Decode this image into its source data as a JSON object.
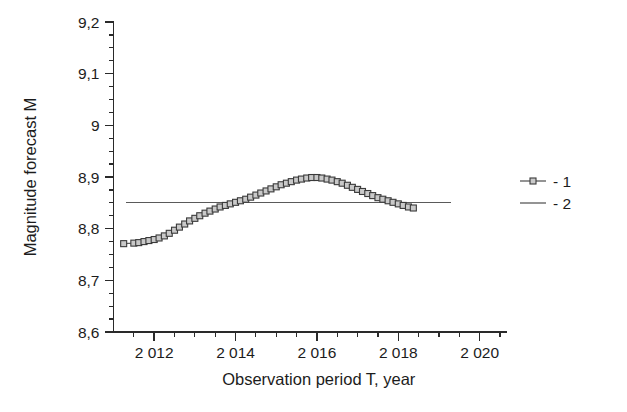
{
  "chart_data": {
    "type": "line",
    "title": "",
    "xlabel": "Observation period T, year",
    "ylabel": "Magnitude forecast  M",
    "xlim": [
      2011.0,
      2020.5
    ],
    "ylim": [
      8.6,
      9.2
    ],
    "grid": false,
    "legend_position": "right",
    "x_tick_labels": [
      "2 012",
      "2 014",
      "2 016",
      "2 018",
      "2 020"
    ],
    "x_tick_values": [
      2012,
      2014,
      2016,
      2018,
      2020
    ],
    "x_minor_step": 0.5,
    "y_tick_labels": [
      "8,6",
      "8,7",
      "8,8",
      "8,9",
      "9",
      "9,1",
      "9,2"
    ],
    "y_tick_values": [
      8.6,
      8.7,
      8.8,
      8.9,
      9.0,
      9.1,
      9.2
    ],
    "y_minor_step": 0.025,
    "series": [
      {
        "name": "- 1",
        "legend_label": "- 1",
        "marker": "square",
        "style": "line-with-markers",
        "color": "#5d5d5d",
        "marker_fill": "#c9c9c9",
        "x": [
          2011.25,
          2011.5,
          2011.62,
          2011.75,
          2011.87,
          2012.0,
          2012.12,
          2012.25,
          2012.37,
          2012.5,
          2012.62,
          2012.75,
          2012.87,
          2013.0,
          2013.12,
          2013.25,
          2013.37,
          2013.5,
          2013.62,
          2013.75,
          2013.87,
          2014.0,
          2014.12,
          2014.25,
          2014.37,
          2014.5,
          2014.62,
          2014.75,
          2014.87,
          2015.0,
          2015.12,
          2015.25,
          2015.37,
          2015.5,
          2015.62,
          2015.75,
          2015.87,
          2016.0,
          2016.12,
          2016.25,
          2016.37,
          2016.5,
          2016.62,
          2016.75,
          2016.87,
          2017.0,
          2017.12,
          2017.25,
          2017.37,
          2017.5,
          2017.62,
          2017.75,
          2017.87,
          2018.0,
          2018.12,
          2018.25,
          2018.37
        ],
        "y": [
          8.771,
          8.772,
          8.773,
          8.775,
          8.777,
          8.779,
          8.782,
          8.786,
          8.791,
          8.797,
          8.803,
          8.809,
          8.815,
          8.82,
          8.825,
          8.83,
          8.834,
          8.838,
          8.842,
          8.845,
          8.848,
          8.851,
          8.854,
          8.857,
          8.861,
          8.865,
          8.869,
          8.873,
          8.877,
          8.881,
          8.885,
          8.888,
          8.891,
          8.894,
          8.896,
          8.898,
          8.899,
          8.899,
          8.898,
          8.896,
          8.894,
          8.891,
          8.888,
          8.884,
          8.88,
          8.876,
          8.872,
          8.868,
          8.864,
          8.86,
          8.857,
          8.854,
          8.851,
          8.848,
          8.845,
          8.842,
          8.84
        ]
      },
      {
        "name": "- 2",
        "legend_label": "- 2",
        "marker": "none",
        "style": "line",
        "color": "#5a5a5a",
        "constant_value": 8.85,
        "x": [
          2011.3,
          2019.3
        ],
        "y": [
          8.85,
          8.85
        ]
      }
    ]
  },
  "legend": {
    "entries": [
      {
        "label": "- 1",
        "marker": "square-with-line"
      },
      {
        "label": "- 2",
        "marker": "line"
      }
    ]
  }
}
